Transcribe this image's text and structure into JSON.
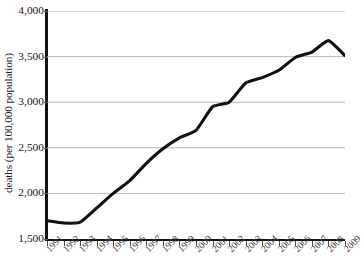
{
  "chart_data": {
    "type": "line",
    "title": "",
    "xlabel": "",
    "ylabel": "deaths (per 100,000 population)",
    "categories": [
      "1991",
      "1992",
      "1993",
      "1994",
      "1995",
      "1996",
      "1997",
      "1998",
      "1999",
      "2000",
      "2001",
      "2002",
      "2003",
      "2004",
      "2005",
      "2006",
      "2007",
      "2008",
      "2009"
    ],
    "values": [
      1700,
      1675,
      1685,
      1840,
      2000,
      2140,
      2330,
      2490,
      2610,
      2690,
      2950,
      3000,
      3210,
      3270,
      3350,
      3490,
      3550,
      3675,
      3510
    ],
    "ylim": [
      1500,
      4000
    ],
    "ytick_values": [
      1500,
      2000,
      2500,
      3000,
      3500,
      4000
    ],
    "ytick_labels": [
      "1,500",
      "2,000",
      "2,500",
      "3,000",
      "3,500",
      "4,000"
    ],
    "grid": true,
    "grid_color": "#b0b0b0",
    "line_color": "#111111",
    "line_width": 3.1,
    "legend": "none",
    "axis_color": "#121212",
    "background": "#ffffff"
  }
}
